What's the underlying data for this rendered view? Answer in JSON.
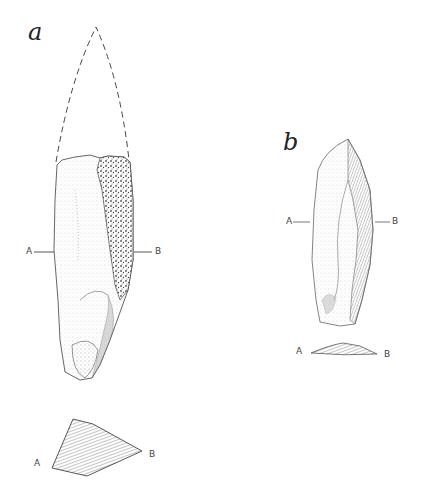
{
  "figure": {
    "colors": {
      "ink": "#333333",
      "stipple": "#8a8a8a",
      "background": "#ffffff"
    },
    "artifacts": [
      {
        "id": "a",
        "label": "a",
        "reconstructed_tip": "dashed outline",
        "section_markers": {
          "left": "A",
          "right": "B"
        },
        "cross_section": {
          "left": "A",
          "right": "B"
        }
      },
      {
        "id": "b",
        "label": "b",
        "section_markers": {
          "left": "A",
          "right": "B"
        },
        "cross_section": {
          "left": "A",
          "right": "B"
        }
      }
    ]
  }
}
